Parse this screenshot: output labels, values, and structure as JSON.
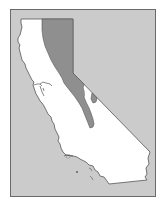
{
  "map": {
    "subject": "California state outline",
    "highlighted_region": "Eastern California / Sierra Nevada range band",
    "colors": {
      "page_background": "#ffffff",
      "frame_fill": "#cbcbcb",
      "frame_border": "#6a6a6a",
      "land_fill": "#ffffff",
      "coast_stroke": "#555555",
      "highlight_fill": "#8f8f8f",
      "highlight_stroke": "#555555"
    },
    "labels": []
  }
}
